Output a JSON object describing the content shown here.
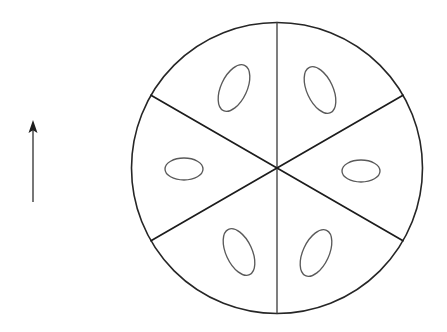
{
  "figure": {
    "background_color": "#ffffff",
    "width": 447,
    "height": 332
  },
  "wheel": {
    "name": "six-sector-circle",
    "center": {
      "x": 277,
      "y": 168
    },
    "radius": 145.5,
    "sector_count": 6,
    "outline_color": "#262626",
    "outline_width": 1.6,
    "fill_color": "#ffffff",
    "spokes": [
      {
        "label": "spoke-north",
        "angle_deg": 90,
        "weight": "thin"
      },
      {
        "label": "spoke-northeast",
        "angle_deg": 30,
        "weight": "thick"
      },
      {
        "label": "spoke-southeast",
        "angle_deg": -30,
        "weight": "thick"
      },
      {
        "label": "spoke-south",
        "angle_deg": -90,
        "weight": "thin"
      },
      {
        "label": "spoke-southwest",
        "angle_deg": -150,
        "weight": "thick"
      },
      {
        "label": "spoke-northwest",
        "angle_deg": 150,
        "weight": "thick"
      }
    ]
  },
  "ellipses": [
    {
      "label": "ellipse-upper-left",
      "cx": 234,
      "cy": 88,
      "rx": 13,
      "ry": 25,
      "rotation_deg": 25,
      "stroke_color": "#5a5a5a"
    },
    {
      "label": "ellipse-upper-right",
      "cx": 320,
      "cy": 90,
      "rx": 13,
      "ry": 25,
      "rotation_deg": -25,
      "stroke_color": "#5a5a5a"
    },
    {
      "label": "ellipse-left",
      "cx": 184,
      "cy": 169,
      "rx": 19,
      "ry": 11,
      "rotation_deg": 0,
      "stroke_color": "#5a5a5a"
    },
    {
      "label": "ellipse-right",
      "cx": 361,
      "cy": 171,
      "rx": 19,
      "ry": 11,
      "rotation_deg": 0,
      "stroke_color": "#5a5a5a"
    },
    {
      "label": "ellipse-lower-left",
      "cx": 239,
      "cy": 252,
      "rx": 13,
      "ry": 25,
      "rotation_deg": -25,
      "stroke_color": "#5a5a5a"
    },
    {
      "label": "ellipse-lower-right",
      "cx": 316,
      "cy": 253,
      "rx": 13,
      "ry": 25,
      "rotation_deg": 25,
      "stroke_color": "#5a5a5a"
    }
  ],
  "arrow": {
    "label": "direction-arrow-up",
    "direction": "up",
    "tip": {
      "x": 33,
      "y": 120
    },
    "tail": {
      "x": 33,
      "y": 202
    },
    "shaft_color": "#4a4a4a",
    "head_color": "#1e1e1e",
    "head_width": 9,
    "head_height": 13
  }
}
